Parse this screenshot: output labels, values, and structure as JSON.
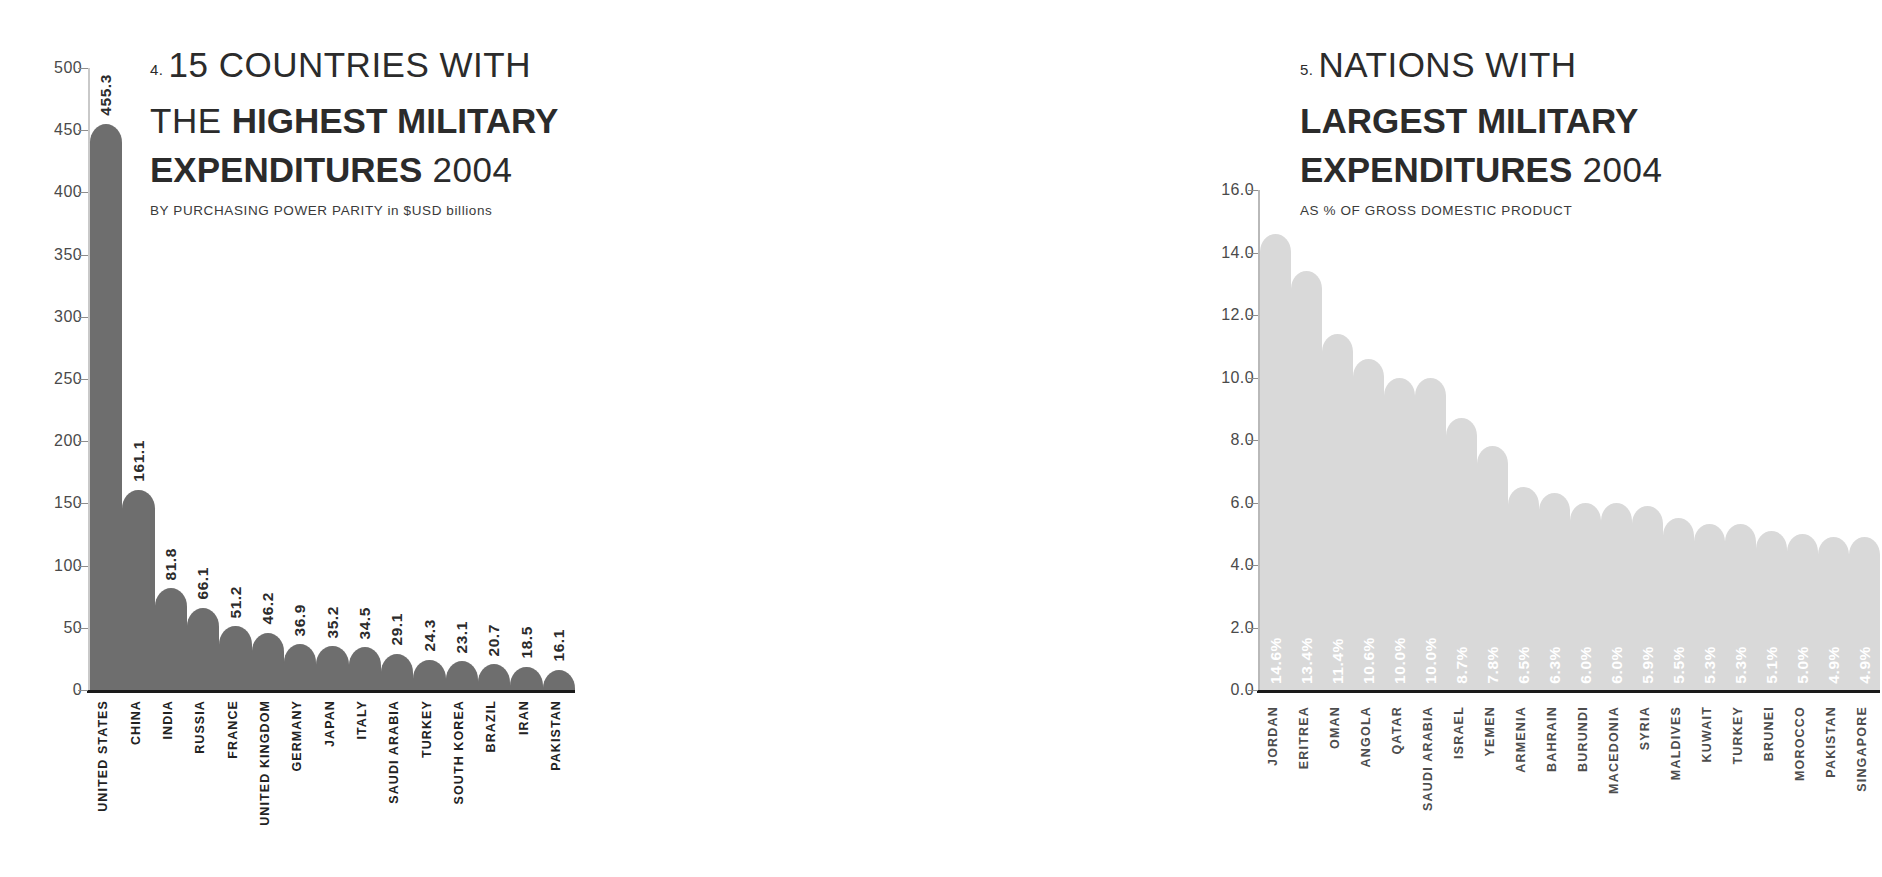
{
  "chart_data": [
    {
      "type": "bar",
      "index_label": "4.",
      "title_lines": [
        {
          "plain": "15 COUNTRIES WITH",
          "bold": ""
        },
        {
          "plain": "THE ",
          "bold": "HIGHEST MILITARY"
        },
        {
          "plain": "",
          "bold": "EXPENDITURES",
          "tail": " 2004"
        }
      ],
      "title": "15 COUNTRIES WITH THE HIGHEST MILITARY EXPENDITURES 2004",
      "subtitle": "BY PURCHASING POWER PARITY in $USD billions",
      "subtitle_caps": "BY PURCHASING POWER PARITY",
      "subtitle_lower": " in $USD billions",
      "xlabel": "",
      "ylabel": "",
      "ylim": [
        0,
        500
      ],
      "yticks": [
        500,
        450,
        400,
        350,
        300,
        250,
        200,
        150,
        100,
        50,
        0
      ],
      "ytick_labels": [
        "500",
        "450",
        "400",
        "350",
        "300",
        "250",
        "200",
        "150",
        "100",
        "50",
        "0"
      ],
      "grid": false,
      "bar_color": "#6e6e6e",
      "value_label_color": "#2b2b2b",
      "categories": [
        "UNITED STATES",
        "CHINA",
        "INDIA",
        "RUSSIA",
        "FRANCE",
        "UNITED KINGDOM",
        "GERMANY",
        "JAPAN",
        "ITALY",
        "SAUDI ARABIA",
        "TURKEY",
        "SOUTH KOREA",
        "BRAZIL",
        "IRAN",
        "PAKISTAN"
      ],
      "values": [
        455.3,
        161.1,
        81.8,
        66.1,
        51.2,
        46.2,
        36.9,
        35.2,
        34.5,
        29.1,
        24.3,
        23.1,
        20.7,
        18.5,
        16.1
      ],
      "value_labels": [
        "455.3",
        "161.1",
        "81.8",
        "66.1",
        "51.2",
        "46.2",
        "36.9",
        "35.2",
        "34.5",
        "29.1",
        "24.3",
        "23.1",
        "20.7",
        "18.5",
        "16.1"
      ]
    },
    {
      "type": "bar",
      "index_label": "5.",
      "title_lines": [
        {
          "plain": "NATIONS WITH",
          "bold": ""
        },
        {
          "plain": "",
          "bold": "LARGEST MILITARY"
        },
        {
          "plain": "",
          "bold": "EXPENDITURES",
          "tail": " 2004"
        }
      ],
      "title": "NATIONS WITH LARGEST MILITARY EXPENDITURES 2004",
      "subtitle": "AS % OF GROSS DOMESTIC PRODUCT",
      "xlabel": "",
      "ylabel": "",
      "ylim": [
        0,
        16
      ],
      "yticks": [
        16.0,
        14.0,
        12.0,
        10.0,
        8.0,
        6.0,
        4.0,
        2.0,
        0.0
      ],
      "ytick_labels": [
        "16.0",
        "14.0",
        "12.0",
        "10.0",
        "8.0",
        "6.0",
        "4.0",
        "2.0",
        "0.0"
      ],
      "grid": false,
      "bar_color": "#d9d9d9",
      "value_label_color": "#ffffff",
      "categories": [
        "JORDAN",
        "ERITREA",
        "OMAN",
        "ANGOLA",
        "QATAR",
        "SAUDI ARABIA",
        "ISRAEL",
        "YEMEN",
        "ARMENIA",
        "BAHRAIN",
        "BURUNDI",
        "MACEDONIA",
        "SYRIA",
        "MALDIVES",
        "KUWAIT",
        "TURKEY",
        "BRUNEI",
        "MOROCCO",
        "PAKISTAN",
        "SINGAPORE"
      ],
      "values": [
        14.6,
        13.4,
        11.4,
        10.6,
        10.0,
        10.0,
        8.7,
        7.8,
        6.5,
        6.3,
        6.0,
        6.0,
        5.9,
        5.5,
        5.3,
        5.3,
        5.1,
        5.0,
        4.9,
        4.9
      ],
      "value_labels": [
        "14.6%",
        "13.4%",
        "11.4%",
        "10.6%",
        "10.0%",
        "10.0%",
        "8.7%",
        "7.8%",
        "6.5%",
        "6.3%",
        "6.0%",
        "6.0%",
        "5.9%",
        "5.5%",
        "5.3%",
        "5.3%",
        "5.1%",
        "5.0%",
        "4.9%",
        "4.9%"
      ]
    }
  ]
}
